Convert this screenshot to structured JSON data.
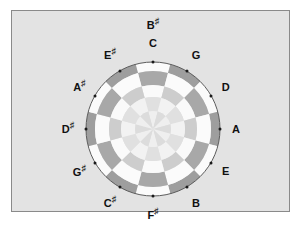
{
  "figure": {
    "background_color": "#e3e3e3",
    "border_color": "#8a8a8a",
    "page_background": "#ffffff"
  },
  "wheel": {
    "center_x": 141,
    "center_y": 118,
    "outer_radius": 67,
    "rings": [
      {
        "name": "outer-ring",
        "outer_radius": 67,
        "inner_radius": 58,
        "colors": [
          "#fbfbfb",
          "#9e9e9e"
        ]
      },
      {
        "name": "second-ring",
        "outer_radius": 58,
        "inner_radius": 44,
        "colors": [
          "#fbfbfb",
          "#a8a8a8"
        ]
      },
      {
        "name": "third-ring",
        "outer_radius": 44,
        "inner_radius": 32,
        "colors": [
          "#fafafa",
          "#cdcdcd"
        ]
      },
      {
        "name": "fourth-ring",
        "outer_radius": 32,
        "inner_radius": 18,
        "colors": [
          "#f2f2f2",
          "#e0e0e0"
        ]
      },
      {
        "name": "pinwheel-center",
        "outer_radius": 18,
        "inner_radius": 0,
        "colors": [
          "#efefef",
          "#dcdcdc"
        ]
      }
    ],
    "outline_color": "#5c5c5c",
    "segment_count": 12
  },
  "notes": [
    {
      "id": "C",
      "label": "C",
      "sharp": false,
      "angle_deg": 0,
      "label_radius": 86,
      "dot_radius": 67
    },
    {
      "id": "G",
      "label": "G",
      "sharp": false,
      "angle_deg": 30,
      "label_radius": 86,
      "dot_radius": 67
    },
    {
      "id": "D",
      "label": "D",
      "sharp": false,
      "angle_deg": 60,
      "label_radius": 84,
      "dot_radius": 67
    },
    {
      "id": "A",
      "label": "A",
      "sharp": false,
      "angle_deg": 90,
      "label_radius": 83,
      "dot_radius": 67
    },
    {
      "id": "E",
      "label": "E",
      "sharp": false,
      "angle_deg": 120,
      "label_radius": 84,
      "dot_radius": 67
    },
    {
      "id": "B",
      "label": "B",
      "sharp": false,
      "angle_deg": 150,
      "label_radius": 86,
      "dot_radius": 67
    },
    {
      "id": "Fs",
      "label": "F",
      "sharp": true,
      "angle_deg": 180,
      "label_radius": 86,
      "dot_radius": 67
    },
    {
      "id": "Cs",
      "label": "C",
      "sharp": true,
      "angle_deg": 210,
      "label_radius": 86,
      "dot_radius": 67
    },
    {
      "id": "Gs",
      "label": "G",
      "sharp": true,
      "angle_deg": 240,
      "label_radius": 85,
      "dot_radius": 67
    },
    {
      "id": "Ds",
      "label": "D",
      "sharp": true,
      "angle_deg": 270,
      "label_radius": 85,
      "dot_radius": 67
    },
    {
      "id": "As",
      "label": "A",
      "sharp": true,
      "angle_deg": 300,
      "label_radius": 85,
      "dot_radius": 67
    },
    {
      "id": "Es",
      "label": "E",
      "sharp": true,
      "angle_deg": 330,
      "label_radius": 86,
      "dot_radius": 67
    },
    {
      "id": "Bs",
      "label": "B",
      "sharp": true,
      "angle_deg": 0,
      "label_radius": 104,
      "dot_radius": null
    }
  ],
  "sharp_symbol": "♯"
}
